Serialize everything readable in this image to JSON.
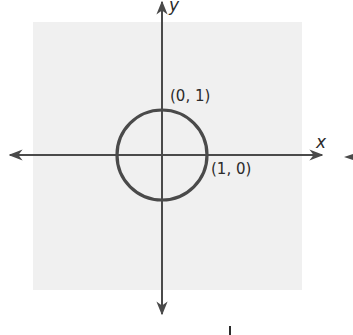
{
  "diagram": {
    "type": "coordinate-plane",
    "background_panel_color": "#f0f0f0",
    "axis_color": "#4a4a4a",
    "circle_color": "#4a4a4a",
    "axes": {
      "x_label": "x",
      "y_label": "y"
    },
    "circle": {
      "center": [
        0,
        0
      ],
      "radius": 1,
      "description": "unit circle"
    },
    "points": [
      {
        "label": "(0, 1)",
        "x": 0,
        "y": 1
      },
      {
        "label": "(1, 0)",
        "x": 1,
        "y": 0
      }
    ]
  }
}
